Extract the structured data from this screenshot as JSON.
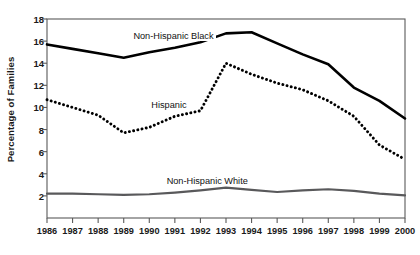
{
  "chart_data": {
    "type": "line",
    "title": "",
    "subtitle": "",
    "xlabel": "",
    "ylabel": "Percentage of Families",
    "categories": [
      "1986",
      "1987",
      "1988",
      "1989",
      "1990",
      "1991",
      "1992",
      "1993",
      "1994",
      "1995",
      "1996",
      "1997",
      "1998",
      "1999",
      "2000"
    ],
    "x": [
      1986,
      1987,
      1988,
      1989,
      1990,
      1991,
      1992,
      1993,
      1994,
      1995,
      1996,
      1997,
      1998,
      1999,
      2000
    ],
    "xlim": [
      1986,
      2000
    ],
    "ylim": [
      0,
      18
    ],
    "yticks": [
      2,
      4,
      6,
      8,
      10,
      12,
      14,
      16,
      18
    ],
    "xticks": [
      "1986",
      "1987",
      "1988",
      "1989",
      "1990",
      "1991",
      "1992",
      "1993",
      "1994",
      "1995",
      "1996",
      "1997",
      "1998",
      "1999",
      "2000"
    ],
    "grid": false,
    "legend_position": "inline-annotations",
    "series": [
      {
        "name": "Non-Hispanic Black",
        "style": "solid",
        "color": "#000000",
        "width": 2.6,
        "values": [
          15.7,
          15.3,
          14.9,
          14.5,
          15.0,
          15.4,
          15.9,
          16.7,
          16.8,
          15.8,
          14.8,
          13.9,
          11.8,
          10.6,
          9.0
        ],
        "label_x": 1989.3,
        "label_y": 16.4
      },
      {
        "name": "Hispanic",
        "style": "dotted",
        "color": "#000000",
        "width": 2.6,
        "values": [
          10.7,
          10.0,
          9.3,
          7.7,
          8.2,
          9.2,
          9.7,
          14.0,
          13.0,
          12.2,
          11.6,
          10.6,
          9.2,
          6.6,
          5.3
        ],
        "label_x": 1990.0,
        "label_y": 10.1
      },
      {
        "name": "Non-Hispanic White",
        "style": "solid",
        "color": "#59595b",
        "width": 2.2,
        "values": [
          2.2,
          2.2,
          2.15,
          2.1,
          2.15,
          2.3,
          2.5,
          2.75,
          2.55,
          2.35,
          2.5,
          2.6,
          2.45,
          2.2,
          2.05
        ],
        "label_x": 1990.6,
        "label_y": 3.25
      }
    ],
    "annotations": [
      {
        "text": "Non-Hispanic Black"
      },
      {
        "text": "Hispanic"
      },
      {
        "text": "Non-Hispanic White"
      }
    ]
  },
  "axes": {
    "frame_color": "#5a5a5a",
    "tick_color": "#5a5a5a"
  }
}
